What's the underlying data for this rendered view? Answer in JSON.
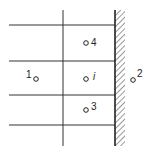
{
  "diagram": {
    "colors": {
      "line": "#333333",
      "background": "#ffffff"
    },
    "grid": {
      "horizontal_lines_y": [
        25,
        61,
        95,
        125
      ],
      "horizontal_line_x_range": [
        9,
        115
      ],
      "vertical_line_x": 63,
      "vertical_line_y_range": [
        10,
        146
      ]
    },
    "wall": {
      "x": 115,
      "width": 10,
      "y_range": [
        10,
        146
      ]
    },
    "nodes": [
      {
        "id": "1",
        "label": "1",
        "cx": 36,
        "cy": 79,
        "label_x": 26,
        "label_y": 78,
        "italic": false
      },
      {
        "id": "4",
        "label": "4",
        "cx": 86,
        "cy": 43,
        "label_x": 91,
        "label_y": 46,
        "italic": false
      },
      {
        "id": "i",
        "label": "i",
        "cx": 86,
        "cy": 79,
        "label_x": 93,
        "label_y": 80,
        "italic": true
      },
      {
        "id": "3",
        "label": "3",
        "cx": 86,
        "cy": 110,
        "label_x": 91,
        "label_y": 110,
        "italic": false
      },
      {
        "id": "2",
        "label": "2",
        "cx": 133,
        "cy": 80,
        "label_x": 137,
        "label_y": 77,
        "italic": false
      }
    ]
  }
}
